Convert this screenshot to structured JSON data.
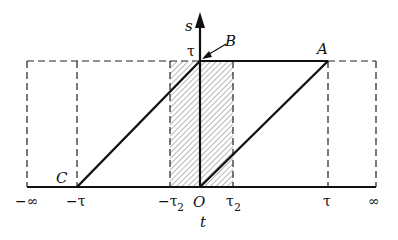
{
  "diagram": {
    "type": "integration-region",
    "axes": {
      "vertical": {
        "label": "s",
        "tick": "τ"
      },
      "horizontal": {
        "label": "t"
      }
    },
    "tick_labels": {
      "neg_inf": "−∞",
      "neg_tau": "−τ",
      "neg_tau2_main": "−τ",
      "neg_tau2_sub": "2",
      "origin": "O",
      "tau2_main": "τ",
      "tau2_sub": "2",
      "tau": "τ",
      "pos_inf": "∞",
      "s_tick_tau": "τ"
    },
    "points": {
      "A": "A",
      "B": "B",
      "C": "C"
    },
    "regions": {
      "hatched": "strip between −τ2 and τ2"
    },
    "colors": {
      "stroke": "#111111",
      "hatch": "#555555",
      "background": "#ffffff"
    }
  }
}
